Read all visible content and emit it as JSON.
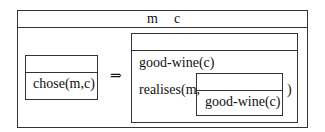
{
  "outer": {
    "header_vars": [
      "m",
      "c"
    ]
  },
  "antecedent": {
    "header": "",
    "conditions": [
      "chose(m,c)"
    ]
  },
  "implication_symbol": "⇒",
  "consequent": {
    "header": "",
    "conditions": [
      "good-wine(c)"
    ],
    "realises_prefix": "realises(m,",
    "realises_suffix": ")",
    "nested": {
      "header": "",
      "conditions": [
        "good-wine(c)"
      ]
    }
  }
}
